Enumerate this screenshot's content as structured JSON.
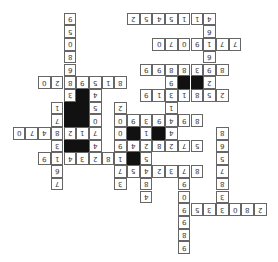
{
  "puzzle": {
    "type": "number-crossword",
    "orientation": "rotated-180",
    "cell_pitch": 12.7,
    "cells": [
      {
        "c": 10,
        "r": 1,
        "v": "2"
      },
      {
        "c": 11,
        "r": 1,
        "v": "5"
      },
      {
        "c": 12,
        "r": 1,
        "v": "4"
      },
      {
        "c": 13,
        "r": 1,
        "v": "5"
      },
      {
        "c": 14,
        "r": 1,
        "v": "1"
      },
      {
        "c": 15,
        "r": 1,
        "v": "1"
      },
      {
        "c": 16,
        "r": 1,
        "v": "4"
      },
      {
        "c": 16,
        "r": 2,
        "v": "6"
      },
      {
        "c": 12,
        "r": 3,
        "v": "0"
      },
      {
        "c": 13,
        "r": 3,
        "v": "7"
      },
      {
        "c": 14,
        "r": 3,
        "v": "0"
      },
      {
        "c": 15,
        "r": 3,
        "v": "9"
      },
      {
        "c": 16,
        "r": 3,
        "v": "1"
      },
      {
        "c": 17,
        "r": 3,
        "v": "7"
      },
      {
        "c": 18,
        "r": 3,
        "v": "7"
      },
      {
        "c": 16,
        "r": 4,
        "v": "6"
      },
      {
        "c": 11,
        "r": 5,
        "v": "9"
      },
      {
        "c": 12,
        "r": 5,
        "v": "9"
      },
      {
        "c": 13,
        "r": 5,
        "v": "8"
      },
      {
        "c": 14,
        "r": 5,
        "v": "8"
      },
      {
        "c": 15,
        "r": 5,
        "v": "3"
      },
      {
        "c": 16,
        "r": 5,
        "v": "9"
      },
      {
        "c": 17,
        "r": 5,
        "v": "8"
      },
      {
        "c": 13,
        "r": 6,
        "v": "9"
      },
      {
        "c": 14,
        "r": 6,
        "v": "#"
      },
      {
        "c": 15,
        "r": 6,
        "v": "#"
      },
      {
        "c": 16,
        "r": 6,
        "v": "2"
      },
      {
        "c": 11,
        "r": 7,
        "v": "9"
      },
      {
        "c": 12,
        "r": 7,
        "v": "1"
      },
      {
        "c": 13,
        "r": 7,
        "v": "3"
      },
      {
        "c": 14,
        "r": 7,
        "v": "1"
      },
      {
        "c": 15,
        "r": 7,
        "v": "8"
      },
      {
        "c": 16,
        "r": 7,
        "v": "5"
      },
      {
        "c": 17,
        "r": 7,
        "v": "2"
      },
      {
        "c": 13,
        "r": 8,
        "v": "1"
      },
      {
        "c": 5,
        "r": 1,
        "v": "9"
      },
      {
        "c": 5,
        "r": 2,
        "v": "5"
      },
      {
        "c": 5,
        "r": 3,
        "v": "0"
      },
      {
        "c": 5,
        "r": 4,
        "v": "8"
      },
      {
        "c": 5,
        "r": 5,
        "v": "6"
      },
      {
        "c": 3,
        "r": 6,
        "v": "0"
      },
      {
        "c": 4,
        "r": 6,
        "v": "2"
      },
      {
        "c": 5,
        "r": 6,
        "v": "8"
      },
      {
        "c": 6,
        "r": 6,
        "v": "9"
      },
      {
        "c": 7,
        "r": 6,
        "v": "5"
      },
      {
        "c": 8,
        "r": 6,
        "v": "1"
      },
      {
        "c": 9,
        "r": 6,
        "v": "8"
      },
      {
        "c": 5,
        "r": 7,
        "v": "3"
      },
      {
        "c": 6,
        "r": 7,
        "v": "#"
      },
      {
        "c": 7,
        "r": 7,
        "v": "4"
      },
      {
        "c": 4,
        "r": 8,
        "v": "1"
      },
      {
        "c": 5,
        "r": 8,
        "v": "#"
      },
      {
        "c": 6,
        "r": 8,
        "v": "#"
      },
      {
        "c": 7,
        "r": 8,
        "v": "5"
      },
      {
        "c": 9,
        "r": 8,
        "v": "2"
      },
      {
        "c": 4,
        "r": 9,
        "v": "7"
      },
      {
        "c": 5,
        "r": 9,
        "v": "#"
      },
      {
        "c": 6,
        "r": 9,
        "v": "#"
      },
      {
        "c": 7,
        "r": 9,
        "v": "0"
      },
      {
        "c": 9,
        "r": 9,
        "v": "0"
      },
      {
        "c": 10,
        "r": 9,
        "v": "9"
      },
      {
        "c": 11,
        "r": 9,
        "v": "3"
      },
      {
        "c": 12,
        "r": 9,
        "v": "9"
      },
      {
        "c": 13,
        "r": 9,
        "v": "4"
      },
      {
        "c": 14,
        "r": 9,
        "v": "9"
      },
      {
        "c": 15,
        "r": 9,
        "v": "8"
      },
      {
        "c": 1,
        "r": 10,
        "v": "0"
      },
      {
        "c": 2,
        "r": 10,
        "v": "7"
      },
      {
        "c": 3,
        "r": 10,
        "v": "4"
      },
      {
        "c": 4,
        "r": 10,
        "v": "8"
      },
      {
        "c": 5,
        "r": 10,
        "v": "2"
      },
      {
        "c": 6,
        "r": 10,
        "v": "1"
      },
      {
        "c": 7,
        "r": 10,
        "v": "7"
      },
      {
        "c": 9,
        "r": 10,
        "v": "0"
      },
      {
        "c": 10,
        "r": 10,
        "v": "#"
      },
      {
        "c": 11,
        "r": 10,
        "v": "1"
      },
      {
        "c": 12,
        "r": 10,
        "v": "#"
      },
      {
        "c": 13,
        "r": 10,
        "v": "4"
      },
      {
        "c": 17,
        "r": 10,
        "v": "8"
      },
      {
        "c": 4,
        "r": 11,
        "v": "3"
      },
      {
        "c": 5,
        "r": 11,
        "v": "#"
      },
      {
        "c": 6,
        "r": 11,
        "v": "#"
      },
      {
        "c": 7,
        "r": 11,
        "v": "4"
      },
      {
        "c": 9,
        "r": 11,
        "v": "9"
      },
      {
        "c": 10,
        "r": 11,
        "v": "4"
      },
      {
        "c": 11,
        "r": 11,
        "v": "2"
      },
      {
        "c": 12,
        "r": 11,
        "v": "8"
      },
      {
        "c": 13,
        "r": 11,
        "v": "2"
      },
      {
        "c": 14,
        "r": 11,
        "v": "7"
      },
      {
        "c": 15,
        "r": 11,
        "v": "5"
      },
      {
        "c": 17,
        "r": 11,
        "v": "6"
      },
      {
        "c": 3,
        "r": 12,
        "v": "9"
      },
      {
        "c": 4,
        "r": 12,
        "v": "1"
      },
      {
        "c": 5,
        "r": 12,
        "v": "4"
      },
      {
        "c": 6,
        "r": 12,
        "v": "3"
      },
      {
        "c": 7,
        "r": 12,
        "v": "2"
      },
      {
        "c": 8,
        "r": 12,
        "v": "8"
      },
      {
        "c": 9,
        "r": 12,
        "v": "1"
      },
      {
        "c": 10,
        "r": 12,
        "v": "#"
      },
      {
        "c": 11,
        "r": 12,
        "v": "5"
      },
      {
        "c": 17,
        "r": 12,
        "v": "5"
      },
      {
        "c": 4,
        "r": 13,
        "v": "6"
      },
      {
        "c": 9,
        "r": 13,
        "v": "7"
      },
      {
        "c": 10,
        "r": 13,
        "v": "5"
      },
      {
        "c": 11,
        "r": 13,
        "v": "4"
      },
      {
        "c": 12,
        "r": 13,
        "v": "2"
      },
      {
        "c": 13,
        "r": 13,
        "v": "3"
      },
      {
        "c": 14,
        "r": 13,
        "v": "7"
      },
      {
        "c": 15,
        "r": 13,
        "v": "8"
      },
      {
        "c": 17,
        "r": 13,
        "v": "7"
      },
      {
        "c": 4,
        "r": 14,
        "v": "7"
      },
      {
        "c": 9,
        "r": 14,
        "v": "3"
      },
      {
        "c": 11,
        "r": 14,
        "v": "8"
      },
      {
        "c": 14,
        "r": 14,
        "v": "9"
      },
      {
        "c": 17,
        "r": 14,
        "v": "8"
      },
      {
        "c": 11,
        "r": 15,
        "v": "4"
      },
      {
        "c": 14,
        "r": 15,
        "v": "0"
      },
      {
        "c": 17,
        "r": 15,
        "v": "3"
      },
      {
        "c": 14,
        "r": 16,
        "v": "9"
      },
      {
        "c": 15,
        "r": 16,
        "v": "5"
      },
      {
        "c": 16,
        "r": 16,
        "v": "3"
      },
      {
        "c": 17,
        "r": 16,
        "v": "3"
      },
      {
        "c": 18,
        "r": 16,
        "v": "0"
      },
      {
        "c": 19,
        "r": 16,
        "v": "8"
      },
      {
        "c": 20,
        "r": 16,
        "v": "2"
      },
      {
        "c": 14,
        "r": 17,
        "v": "9"
      },
      {
        "c": 14,
        "r": 18,
        "v": "8"
      },
      {
        "c": 14,
        "r": 19,
        "v": "9"
      }
    ]
  }
}
